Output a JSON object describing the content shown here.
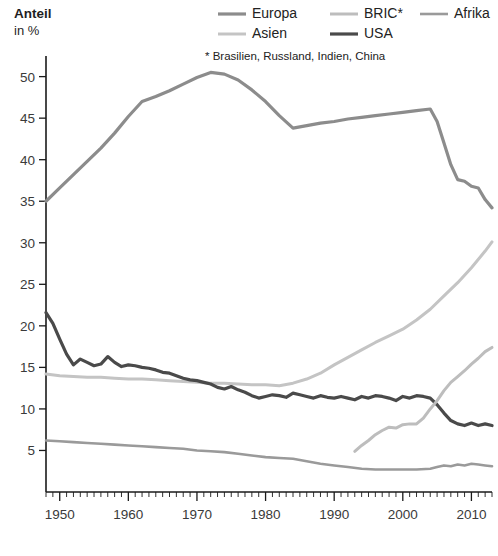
{
  "axis": {
    "y_title_line1": "Anteil",
    "y_title_line2": "in %",
    "y_ticks": [
      5,
      10,
      15,
      20,
      25,
      30,
      35,
      40,
      45,
      50
    ],
    "x_ticks": [
      1950,
      1960,
      1970,
      1980,
      1990,
      2000,
      2010
    ]
  },
  "legend": {
    "items": [
      {
        "label": "Europa",
        "color": "#8c8c8c",
        "width": 3.2
      },
      {
        "label": "BRIC*",
        "color": "#bdbdbd",
        "width": 3.0
      },
      {
        "label": "Afrika",
        "color": "#9a9a9a",
        "width": 2.6
      },
      {
        "label": "Asien",
        "color": "#c4c4c4",
        "width": 3.0
      },
      {
        "label": "USA",
        "color": "#4a4a4a",
        "width": 3.2
      }
    ],
    "footnote": "* Brasilien, Russland, Indien, China"
  },
  "chart_data": {
    "type": "line",
    "title": "",
    "xlabel": "",
    "ylabel": "Anteil in %",
    "xlim": [
      1948,
      2013
    ],
    "ylim": [
      0,
      52
    ],
    "grid": false,
    "legend_position": "top-right",
    "series": [
      {
        "name": "Europa",
        "color": "#8c8c8c",
        "stroke_width": 3.2,
        "points": [
          [
            1948,
            35.0
          ],
          [
            1950,
            36.6
          ],
          [
            1952,
            38.2
          ],
          [
            1954,
            39.8
          ],
          [
            1956,
            41.4
          ],
          [
            1958,
            43.2
          ],
          [
            1960,
            45.2
          ],
          [
            1962,
            47.0
          ],
          [
            1964,
            47.6
          ],
          [
            1966,
            48.3
          ],
          [
            1968,
            49.1
          ],
          [
            1970,
            49.9
          ],
          [
            1972,
            50.5
          ],
          [
            1974,
            50.3
          ],
          [
            1976,
            49.6
          ],
          [
            1978,
            48.4
          ],
          [
            1980,
            47.0
          ],
          [
            1982,
            45.3
          ],
          [
            1984,
            43.8
          ],
          [
            1986,
            44.1
          ],
          [
            1988,
            44.4
          ],
          [
            1990,
            44.6
          ],
          [
            1992,
            44.9
          ],
          [
            1994,
            45.1
          ],
          [
            1996,
            45.3
          ],
          [
            1998,
            45.5
          ],
          [
            2000,
            45.7
          ],
          [
            2002,
            45.9
          ],
          [
            2004,
            46.1
          ],
          [
            2005,
            44.6
          ],
          [
            2006,
            42.0
          ],
          [
            2007,
            39.4
          ],
          [
            2008,
            37.6
          ],
          [
            2009,
            37.4
          ],
          [
            2010,
            36.8
          ],
          [
            2011,
            36.6
          ],
          [
            2012,
            35.2
          ],
          [
            2013,
            34.2
          ]
        ]
      },
      {
        "name": "Asien",
        "color": "#c4c4c4",
        "stroke_width": 3.0,
        "points": [
          [
            1948,
            14.2
          ],
          [
            1950,
            14.0
          ],
          [
            1952,
            13.9
          ],
          [
            1954,
            13.8
          ],
          [
            1956,
            13.8
          ],
          [
            1958,
            13.7
          ],
          [
            1960,
            13.6
          ],
          [
            1962,
            13.6
          ],
          [
            1964,
            13.5
          ],
          [
            1966,
            13.4
          ],
          [
            1968,
            13.3
          ],
          [
            1970,
            13.2
          ],
          [
            1972,
            13.1
          ],
          [
            1974,
            13.1
          ],
          [
            1976,
            13.0
          ],
          [
            1978,
            12.9
          ],
          [
            1980,
            12.9
          ],
          [
            1982,
            12.8
          ],
          [
            1984,
            13.1
          ],
          [
            1986,
            13.6
          ],
          [
            1988,
            14.3
          ],
          [
            1990,
            15.3
          ],
          [
            1992,
            16.2
          ],
          [
            1994,
            17.1
          ],
          [
            1996,
            18.0
          ],
          [
            1998,
            18.8
          ],
          [
            2000,
            19.6
          ],
          [
            2002,
            20.7
          ],
          [
            2004,
            22.0
          ],
          [
            2006,
            23.6
          ],
          [
            2008,
            25.2
          ],
          [
            2010,
            27.0
          ],
          [
            2012,
            29.0
          ],
          [
            2013,
            30.1
          ]
        ]
      },
      {
        "name": "USA",
        "color": "#4a4a4a",
        "stroke_width": 3.2,
        "points": [
          [
            1948,
            21.6
          ],
          [
            1949,
            20.3
          ],
          [
            1950,
            18.4
          ],
          [
            1951,
            16.6
          ],
          [
            1952,
            15.3
          ],
          [
            1953,
            16.0
          ],
          [
            1954,
            15.6
          ],
          [
            1955,
            15.2
          ],
          [
            1956,
            15.4
          ],
          [
            1957,
            16.3
          ],
          [
            1958,
            15.6
          ],
          [
            1959,
            15.1
          ],
          [
            1960,
            15.3
          ],
          [
            1961,
            15.2
          ],
          [
            1962,
            15.0
          ],
          [
            1963,
            14.9
          ],
          [
            1964,
            14.7
          ],
          [
            1965,
            14.4
          ],
          [
            1966,
            14.3
          ],
          [
            1967,
            14.0
          ],
          [
            1968,
            13.7
          ],
          [
            1969,
            13.5
          ],
          [
            1970,
            13.4
          ],
          [
            1971,
            13.2
          ],
          [
            1972,
            13.0
          ],
          [
            1973,
            12.6
          ],
          [
            1974,
            12.4
          ],
          [
            1975,
            12.7
          ],
          [
            1976,
            12.3
          ],
          [
            1977,
            12.0
          ],
          [
            1978,
            11.6
          ],
          [
            1979,
            11.3
          ],
          [
            1980,
            11.5
          ],
          [
            1981,
            11.7
          ],
          [
            1982,
            11.6
          ],
          [
            1983,
            11.4
          ],
          [
            1984,
            11.9
          ],
          [
            1985,
            11.7
          ],
          [
            1986,
            11.5
          ],
          [
            1987,
            11.3
          ],
          [
            1988,
            11.6
          ],
          [
            1989,
            11.4
          ],
          [
            1990,
            11.3
          ],
          [
            1991,
            11.5
          ],
          [
            1992,
            11.3
          ],
          [
            1993,
            11.1
          ],
          [
            1994,
            11.5
          ],
          [
            1995,
            11.3
          ],
          [
            1996,
            11.6
          ],
          [
            1997,
            11.5
          ],
          [
            1998,
            11.3
          ],
          [
            1999,
            11.0
          ],
          [
            2000,
            11.5
          ],
          [
            2001,
            11.3
          ],
          [
            2002,
            11.6
          ],
          [
            2003,
            11.5
          ],
          [
            2004,
            11.3
          ],
          [
            2005,
            10.5
          ],
          [
            2006,
            9.5
          ],
          [
            2007,
            8.6
          ],
          [
            2008,
            8.2
          ],
          [
            2009,
            8.0
          ],
          [
            2010,
            8.3
          ],
          [
            2011,
            8.0
          ],
          [
            2012,
            8.2
          ],
          [
            2013,
            8.0
          ]
        ]
      },
      {
        "name": "BRIC*",
        "color": "#bdbdbd",
        "stroke_width": 3.0,
        "points": [
          [
            1993,
            4.9
          ],
          [
            1994,
            5.6
          ],
          [
            1995,
            6.2
          ],
          [
            1996,
            6.9
          ],
          [
            1997,
            7.4
          ],
          [
            1998,
            7.8
          ],
          [
            1999,
            7.7
          ],
          [
            2000,
            8.1
          ],
          [
            2001,
            8.2
          ],
          [
            2002,
            8.2
          ],
          [
            2003,
            8.9
          ],
          [
            2004,
            10.0
          ],
          [
            2005,
            11.0
          ],
          [
            2006,
            12.2
          ],
          [
            2007,
            13.2
          ],
          [
            2008,
            13.9
          ],
          [
            2009,
            14.6
          ],
          [
            2010,
            15.4
          ],
          [
            2011,
            16.1
          ],
          [
            2012,
            16.9
          ],
          [
            2013,
            17.4
          ]
        ]
      },
      {
        "name": "Afrika",
        "color": "#9a9a9a",
        "stroke_width": 2.6,
        "points": [
          [
            1948,
            6.2
          ],
          [
            1950,
            6.1
          ],
          [
            1952,
            6.0
          ],
          [
            1954,
            5.9
          ],
          [
            1956,
            5.8
          ],
          [
            1958,
            5.7
          ],
          [
            1960,
            5.6
          ],
          [
            1962,
            5.5
          ],
          [
            1964,
            5.4
          ],
          [
            1966,
            5.3
          ],
          [
            1968,
            5.2
          ],
          [
            1970,
            5.0
          ],
          [
            1972,
            4.9
          ],
          [
            1974,
            4.8
          ],
          [
            1976,
            4.6
          ],
          [
            1978,
            4.4
          ],
          [
            1980,
            4.2
          ],
          [
            1982,
            4.1
          ],
          [
            1984,
            4.0
          ],
          [
            1986,
            3.7
          ],
          [
            1988,
            3.4
          ],
          [
            1990,
            3.2
          ],
          [
            1992,
            3.0
          ],
          [
            1994,
            2.8
          ],
          [
            1996,
            2.7
          ],
          [
            1998,
            2.7
          ],
          [
            2000,
            2.7
          ],
          [
            2002,
            2.7
          ],
          [
            2004,
            2.8
          ],
          [
            2005,
            3.0
          ],
          [
            2006,
            3.2
          ],
          [
            2007,
            3.1
          ],
          [
            2008,
            3.3
          ],
          [
            2009,
            3.2
          ],
          [
            2010,
            3.4
          ],
          [
            2011,
            3.3
          ],
          [
            2012,
            3.2
          ],
          [
            2013,
            3.1
          ]
        ]
      }
    ]
  }
}
